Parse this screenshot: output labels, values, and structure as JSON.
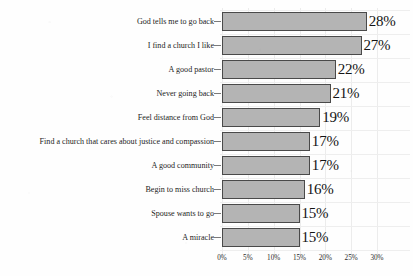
{
  "chart_data": {
    "type": "bar",
    "orientation": "horizontal",
    "title": "",
    "subtitle": "",
    "xlabel": "",
    "ylabel": "",
    "xlim": [
      0,
      30
    ],
    "xticks": [
      "0%",
      "5%",
      "10%",
      "15%",
      "20%",
      "25%",
      "30%"
    ],
    "xtick_values": [
      0,
      5,
      10,
      15,
      20,
      25,
      30
    ],
    "grid": true,
    "legend": "none",
    "categories": [
      "God tells me to go back",
      "I find a church I like",
      "A good pastor",
      "Never going back",
      "Feel distance from God",
      "Find a church that cares about justice and compassion",
      "A good community",
      "Begin to miss church",
      "Spouse wants to go",
      "A miracle"
    ],
    "values": [
      28,
      27,
      22,
      21,
      19,
      17,
      17,
      16,
      15,
      15
    ],
    "value_labels": [
      "28%",
      "27%",
      "22%",
      "21%",
      "19%",
      "17%",
      "17%",
      "16%",
      "15%",
      "15%"
    ],
    "bar_color": "#b4b4b4",
    "bar_border_color": "#4a4a4a",
    "grid_color": "#ececec",
    "text_color": "#1a1a1a"
  }
}
